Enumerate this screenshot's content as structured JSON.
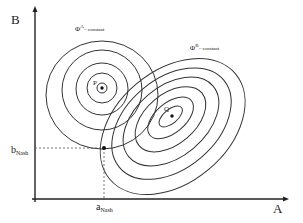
{
  "diagram": {
    "axes": {
      "x_label": "A",
      "y_label": "B"
    },
    "labels": {
      "phi_a_symbol": "Φ",
      "phi_a_sup": "A",
      "phi_a_rest": "= constant",
      "phi_b_symbol": "Φ",
      "phi_b_sup": "B",
      "phi_b_rest": "= constant",
      "point_p": "P",
      "point_q": "Q",
      "a_nash_base": "a",
      "a_nash_sub": "Nash",
      "b_nash_base": "b",
      "b_nash_sub": "Nash"
    },
    "colors": {
      "line": "#333333",
      "background": "#ffffff"
    }
  }
}
